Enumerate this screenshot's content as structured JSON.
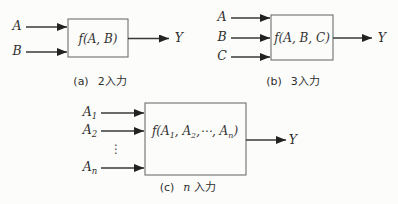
{
  "figure": {
    "colors": {
      "background": "#fcfcfa",
      "arrow_line": "#3a3a3a",
      "box_border": "#6e6e6e",
      "text": "#2f2f2f"
    }
  },
  "diagrams": {
    "a": {
      "inputs": [
        {
          "base": "A",
          "sub": ""
        },
        {
          "base": "B",
          "sub": ""
        }
      ],
      "box_label": "f(A, B)",
      "output": "Y",
      "caption_label": "(a)",
      "caption_var": "",
      "caption_text": "2入力"
    },
    "b": {
      "inputs": [
        {
          "base": "A",
          "sub": ""
        },
        {
          "base": "B",
          "sub": ""
        },
        {
          "base": "C",
          "sub": ""
        }
      ],
      "box_label": "f(A, B, C)",
      "output": "Y",
      "caption_label": "(b)",
      "caption_var": "",
      "caption_text": "3入力"
    },
    "c": {
      "inputs": [
        {
          "base": "A",
          "sub": "1"
        },
        {
          "base": "A",
          "sub": "2"
        },
        {
          "base": "A",
          "sub": "n"
        }
      ],
      "dots": "⋮",
      "box_label_parts": {
        "p1": "f(A",
        "s1": "1",
        "p2": ", A",
        "s2": "2",
        "p3": ",⋯, A",
        "s3": "n",
        "p4": ")"
      },
      "output": "Y",
      "caption_label": "(c)",
      "caption_var": "n",
      "caption_text": "入力"
    }
  }
}
